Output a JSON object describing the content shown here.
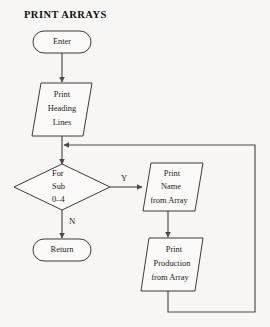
{
  "diagram": {
    "title": "PRINT ARRAYS",
    "type": "flowchart",
    "nodes": {
      "enter": {
        "label": "Enter",
        "shape": "terminator"
      },
      "print_heading": {
        "line1": "Print",
        "line2": "Heading",
        "line3": "Lines",
        "shape": "input-output"
      },
      "decision": {
        "line1": "For",
        "line2": "Sub",
        "line3": "0–4",
        "shape": "decision"
      },
      "print_name": {
        "line1": "Print",
        "line2": "Name",
        "line3": "from Array",
        "shape": "input-output"
      },
      "print_production": {
        "line1": "Print",
        "line2": "Production",
        "line3": "from Array",
        "shape": "input-output"
      },
      "return": {
        "label": "Return",
        "shape": "terminator"
      }
    },
    "branch_labels": {
      "yes": "Y",
      "no": "N"
    },
    "colors": {
      "background": "#f7f6f4",
      "shape_fill": "#fbfaf9",
      "stroke": "#3b3b3b",
      "connector": "#4a4a4a",
      "text": "#1a1a1a"
    }
  }
}
